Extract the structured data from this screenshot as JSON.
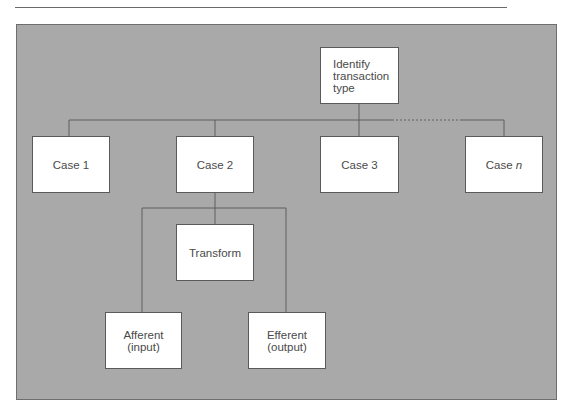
{
  "diagram": {
    "type": "hierarchy",
    "root": {
      "id": "identify",
      "label_lines": [
        "Identify",
        "transaction",
        "type"
      ]
    },
    "cases": [
      {
        "id": "case1",
        "label": "Case 1"
      },
      {
        "id": "case2",
        "label": "Case 2"
      },
      {
        "id": "case3",
        "label": "Case 3"
      },
      {
        "id": "casen",
        "label_prefix": "Case ",
        "label_italic": "n"
      }
    ],
    "case2_children": [
      {
        "id": "transform",
        "label": "Transform"
      },
      {
        "id": "afferent",
        "label_lines": [
          "Afferent",
          "(input)"
        ]
      },
      {
        "id": "efferent",
        "label_lines": [
          "Efferent",
          "(output)"
        ]
      }
    ],
    "edges": [
      [
        "identify",
        "case1"
      ],
      [
        "identify",
        "case2"
      ],
      [
        "identify",
        "case3"
      ],
      [
        "identify",
        "casen",
        "dotted"
      ],
      [
        "case2",
        "transform"
      ],
      [
        "case2",
        "afferent"
      ],
      [
        "case2",
        "efferent"
      ]
    ],
    "colors": {
      "panel": "#a9a9a9",
      "box": "#ffffff",
      "line": "#5e5e5e",
      "text": "#4a4a4a"
    }
  }
}
